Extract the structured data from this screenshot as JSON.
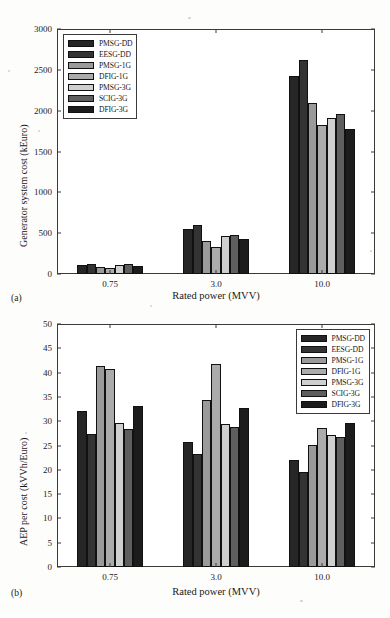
{
  "figure": {
    "panels": [
      {
        "tag": "(a)",
        "legend_position": "upper-left-inside",
        "chart": {
          "type": "bar",
          "title": "",
          "xlabel": "Rated power (MVV)",
          "ylabel": "Generator system cost (kEuro)",
          "categories": [
            "0.75",
            "3.0",
            "10.0"
          ],
          "yticks": [
            0,
            500,
            1000,
            1500,
            2000,
            2500,
            3000
          ],
          "ylim": [
            0,
            3000
          ],
          "grid": false,
          "series": [
            {
              "name": "PMSG-DD",
              "color": "#262626",
              "values": [
                105,
                555,
                2420
              ]
            },
            {
              "name": "EESG-DD",
              "color": "#333333",
              "values": [
                120,
                595,
                2615
              ]
            },
            {
              "name": "PMSG-1G",
              "color": "#9a9a9a",
              "values": [
                80,
                400,
                2090
              ]
            },
            {
              "name": "DFIG-1G",
              "color": "#ababab",
              "values": [
                78,
                335,
                1830
              ]
            },
            {
              "name": "PMSG-3G",
              "color": "#cfcfcf",
              "values": [
                108,
                465,
                1915
              ]
            },
            {
              "name": "SCIG-3G",
              "color": "#5e5e5e",
              "values": [
                120,
                480,
                1960
              ]
            },
            {
              "name": "DFIG-3G",
              "color": "#1c1c1c",
              "values": [
                100,
                430,
                1770
              ]
            }
          ]
        }
      },
      {
        "tag": "(b)",
        "legend_position": "upper-right-inside",
        "chart": {
          "type": "bar",
          "title": "",
          "xlabel": "Rated power (MVV)",
          "ylabel": "AEP per cost (kVVh/Euro)",
          "categories": [
            "0.75",
            "3.0",
            "10.0"
          ],
          "yticks": [
            0,
            5,
            10,
            15,
            20,
            25,
            30,
            35,
            40,
            45,
            50
          ],
          "ylim": [
            0,
            50
          ],
          "grid": false,
          "series": [
            {
              "name": "PMSG-DD",
              "color": "#262626",
              "values": [
                32.2,
                25.8,
                22.1
              ]
            },
            {
              "name": "EESG-DD",
              "color": "#333333",
              "values": [
                27.3,
                23.2,
                19.5
              ]
            },
            {
              "name": "PMSG-1G",
              "color": "#9a9a9a",
              "values": [
                41.3,
                34.4,
                25.1
              ]
            },
            {
              "name": "DFIG-1G",
              "color": "#ababab",
              "values": [
                40.7,
                41.7,
                28.7
              ]
            },
            {
              "name": "PMSG-3G",
              "color": "#cfcfcf",
              "values": [
                29.6,
                29.4,
                27.1
              ]
            },
            {
              "name": "SCIG-3G",
              "color": "#5e5e5e",
              "values": [
                28.3,
                28.9,
                26.8
              ]
            },
            {
              "name": "DFIG-3G",
              "color": "#1c1c1c",
              "values": [
                33.1,
                32.8,
                29.7
              ]
            }
          ]
        }
      }
    ]
  },
  "chart_data": [
    {
      "type": "bar",
      "panel": "(a)",
      "title": "",
      "xlabel": "Rated power (MVV)",
      "ylabel": "Generator system cost (kEuro)",
      "categories": [
        "0.75",
        "3.0",
        "10.0"
      ],
      "ylim": [
        0,
        3000
      ],
      "yticks": [
        0,
        500,
        1000,
        1500,
        2000,
        2500,
        3000
      ],
      "grid": false,
      "legend_position": "upper left (inside axes)",
      "series": [
        {
          "name": "PMSG-DD",
          "values": [
            105,
            555,
            2420
          ]
        },
        {
          "name": "EESG-DD",
          "values": [
            120,
            595,
            2615
          ]
        },
        {
          "name": "PMSG-1G",
          "values": [
            80,
            400,
            2090
          ]
        },
        {
          "name": "DFIG-1G",
          "values": [
            78,
            335,
            1830
          ]
        },
        {
          "name": "PMSG-3G",
          "values": [
            108,
            465,
            1915
          ]
        },
        {
          "name": "SCIG-3G",
          "values": [
            120,
            480,
            1960
          ]
        },
        {
          "name": "DFIG-3G",
          "values": [
            100,
            430,
            1770
          ]
        }
      ]
    },
    {
      "type": "bar",
      "panel": "(b)",
      "title": "",
      "xlabel": "Rated power (MVV)",
      "ylabel": "AEP per cost (kVVh/Euro)",
      "categories": [
        "0.75",
        "3.0",
        "10.0"
      ],
      "ylim": [
        0,
        50
      ],
      "yticks": [
        0,
        5,
        10,
        15,
        20,
        25,
        30,
        35,
        40,
        45,
        50
      ],
      "grid": false,
      "legend_position": "upper right (inside axes)",
      "series": [
        {
          "name": "PMSG-DD",
          "values": [
            32.2,
            25.8,
            22.1
          ]
        },
        {
          "name": "EESG-DD",
          "values": [
            27.3,
            23.2,
            19.5
          ]
        },
        {
          "name": "PMSG-1G",
          "values": [
            41.3,
            34.4,
            25.1
          ]
        },
        {
          "name": "DFIG-1G",
          "values": [
            40.7,
            41.7,
            28.7
          ]
        },
        {
          "name": "PMSG-3G",
          "values": [
            29.6,
            29.4,
            27.1
          ]
        },
        {
          "name": "SCIG-3G",
          "values": [
            28.3,
            28.9,
            26.8
          ]
        },
        {
          "name": "DFIG-3G",
          "values": [
            33.1,
            32.8,
            29.7
          ]
        }
      ]
    }
  ]
}
